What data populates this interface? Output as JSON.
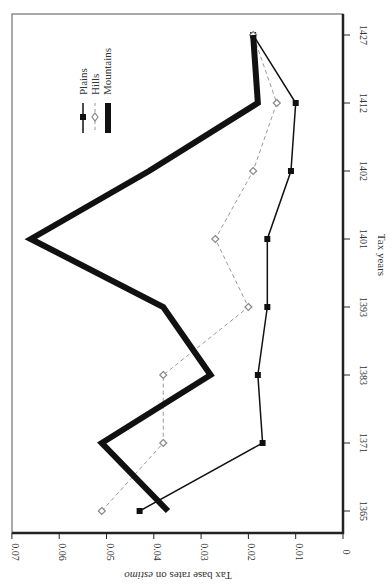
{
  "chart_data": {
    "type": "line",
    "orientation": "rotated-90-clockwise",
    "title": "",
    "xlabel": "Tax years",
    "ylabel": "Tax base rates on estimo",
    "ylabel_italic_word": "estimo",
    "ylim": [
      0,
      0.07
    ],
    "yticks": [
      "0",
      "0.01",
      "0.02",
      "0.03",
      "0.04",
      "0.05",
      "0.06",
      "0.07"
    ],
    "categories": [
      "1365",
      "1371",
      "1383",
      "1393",
      "1401",
      "1402",
      "1412",
      "1427"
    ],
    "series": [
      {
        "name": "Plains",
        "style": "solid-thin-square-marker",
        "color": "#111111",
        "values": [
          0.043,
          0.017,
          0.018,
          0.016,
          0.016,
          0.011,
          0.01,
          0.019
        ]
      },
      {
        "name": "Hills",
        "style": "dashed-diamond-marker",
        "color": "#999999",
        "values": [
          0.051,
          0.038,
          0.038,
          0.02,
          0.027,
          0.019,
          0.014,
          0.019
        ]
      },
      {
        "name": "Mountains",
        "style": "solid-thick",
        "color": "#111111",
        "values": [
          0.037,
          0.051,
          0.028,
          0.038,
          0.066,
          0.041,
          0.018,
          0.019
        ]
      }
    ],
    "legend": {
      "position": "upper-left-of-rotated-plot",
      "entries": [
        "Plains",
        "Hills",
        "Mountains"
      ]
    },
    "grid": false
  },
  "axis": {
    "xlabel": "Tax years",
    "ylabel_prefix": "Tax base rates on ",
    "ylabel_italic": "estimo"
  },
  "legend": {
    "items": [
      {
        "label": "Plains"
      },
      {
        "label": "Hills"
      },
      {
        "label": "Mountains"
      }
    ]
  }
}
